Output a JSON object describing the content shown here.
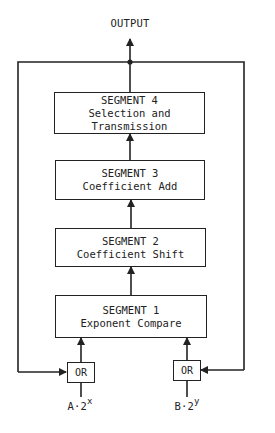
{
  "diagram": {
    "output_label": "OUTPUT",
    "segments": [
      {
        "title": "SEGMENT 4",
        "lines": [
          "Selection and",
          "Transmission"
        ]
      },
      {
        "title": "SEGMENT 3",
        "lines": [
          "Coefficient Add"
        ]
      },
      {
        "title": "SEGMENT 2",
        "lines": [
          "Coefficient Shift"
        ]
      },
      {
        "title": "SEGMENT 1",
        "lines": [
          "Exponent Compare"
        ]
      }
    ],
    "gates": [
      {
        "label": "OR",
        "input": {
          "base": "A·2",
          "exp": "x"
        }
      },
      {
        "label": "OR",
        "input": {
          "base": "B·2",
          "exp": "y"
        }
      }
    ],
    "stroke_color": "#222222",
    "background": "#ffffff"
  }
}
